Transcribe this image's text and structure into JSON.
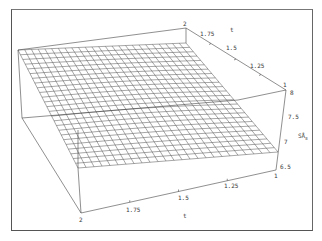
{
  "chart_data": {
    "type": "surface3d",
    "title": "",
    "xlabel": "t",
    "ylabel": "t",
    "zlabel": "SÅ₈",
    "x_axis": {
      "label": "t",
      "ticks": [
        "2",
        "1.75",
        "1.5",
        "1.25",
        "1"
      ],
      "range": [
        1,
        2
      ]
    },
    "y_axis": {
      "label": "t",
      "ticks": [
        "2",
        "1.75",
        "1.5",
        "1.25",
        "1"
      ],
      "range": [
        1,
        2
      ]
    },
    "z_axis": {
      "label": "SÅ₈",
      "ticks": [
        "8",
        "7.5",
        "7",
        "6.5"
      ],
      "range": [
        6.5,
        8
      ]
    },
    "grid_resolution": [
      25,
      25
    ],
    "surface_corners": {
      "x2_y2": 8.0,
      "x2_y1": 7.6,
      "x1_y2": 7.1,
      "x1_y1": 6.8
    }
  },
  "labels": {
    "front_axis_title": "t",
    "back_axis_title": "t",
    "z_axis_title": "SÅ",
    "z_axis_subscript": "8",
    "front_ticks": [
      "2",
      "1.75",
      "1.5",
      "1.25",
      "1"
    ],
    "back_ticks": [
      "2",
      "1.75",
      "1.5",
      "1.25",
      "1"
    ],
    "z_ticks": [
      "8",
      "7.5",
      "7",
      "6.5"
    ]
  }
}
